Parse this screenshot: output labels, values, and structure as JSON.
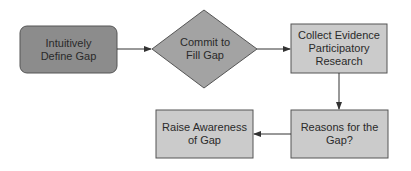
{
  "diagram": {
    "nodes": [
      {
        "id": "define",
        "shape": "rounded-rect",
        "label": "Intuitively\nDefine Gap",
        "fill": "#8c8c8c"
      },
      {
        "id": "commit",
        "shape": "diamond",
        "label": "Commit to\nFill Gap",
        "fill": "#a3a3a3"
      },
      {
        "id": "collect",
        "shape": "rect",
        "label": "Collect Evidence\nParticipatory\nResearch",
        "fill": "#cbcbcb"
      },
      {
        "id": "reasons",
        "shape": "rect",
        "label": "Reasons for the\nGap?",
        "fill": "#cbcbcb"
      },
      {
        "id": "raise",
        "shape": "rect",
        "label": "Raise Awareness\nof Gap",
        "fill": "#cbcbcb"
      }
    ],
    "edges": [
      {
        "from": "define",
        "to": "commit"
      },
      {
        "from": "commit",
        "to": "collect"
      },
      {
        "from": "collect",
        "to": "reasons"
      },
      {
        "from": "reasons",
        "to": "raise"
      }
    ],
    "stroke": "#555555"
  }
}
